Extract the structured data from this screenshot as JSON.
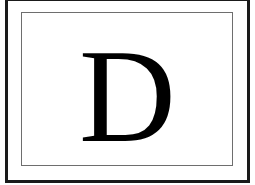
{
  "card": {
    "letter": "D",
    "colors": {
      "background": "#ffffff",
      "outer_border": "#1a1a1a",
      "inner_border": "#6e6e6e",
      "letter": "#000000"
    }
  }
}
